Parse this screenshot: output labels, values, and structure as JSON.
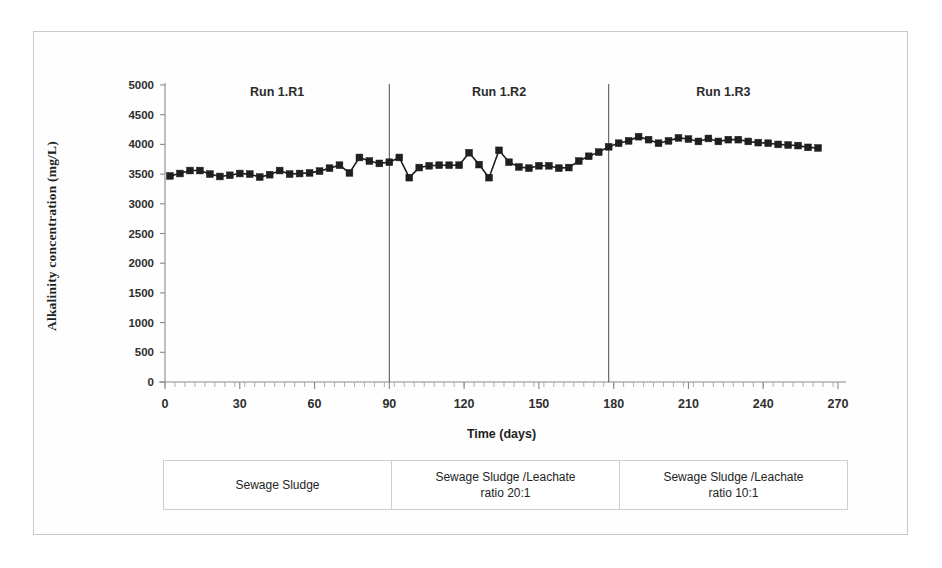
{
  "chart_data": {
    "type": "line",
    "title": "",
    "xlabel": "Time (days)",
    "ylabel": "Alkalinity concentration (mg/L)",
    "xlim": [
      0,
      270
    ],
    "ylim": [
      0,
      5000
    ],
    "y_ticks": [
      0,
      500,
      1000,
      1500,
      2000,
      2500,
      3000,
      3500,
      4000,
      4500,
      5000
    ],
    "x_ticks": [
      0,
      30,
      60,
      90,
      120,
      150,
      180,
      210,
      240,
      270
    ],
    "x_minor_tick_step": 4,
    "grid": false,
    "legend": "none",
    "marker": "square",
    "marker_color": "#1f1f1f",
    "line_color": "#1c1c1c",
    "series": [
      {
        "name": "Alkalinity concentration",
        "x": [
          2,
          6,
          10,
          14,
          18,
          22,
          26,
          30,
          34,
          38,
          42,
          46,
          50,
          54,
          58,
          62,
          66,
          70,
          74,
          78,
          82,
          86,
          90,
          94,
          98,
          102,
          106,
          110,
          114,
          118,
          122,
          126,
          130,
          134,
          138,
          142,
          146,
          150,
          154,
          158,
          162,
          166,
          170,
          174,
          178,
          182,
          186,
          190,
          194,
          198,
          202,
          206,
          210,
          214,
          218,
          222,
          226,
          230,
          234,
          238,
          242,
          246,
          250,
          254,
          258,
          262
        ],
        "y": [
          3470,
          3510,
          3560,
          3560,
          3500,
          3460,
          3480,
          3510,
          3500,
          3450,
          3490,
          3560,
          3500,
          3510,
          3520,
          3550,
          3600,
          3650,
          3520,
          3780,
          3720,
          3680,
          3700,
          3780,
          3440,
          3610,
          3640,
          3650,
          3650,
          3650,
          3860,
          3660,
          3440,
          3900,
          3700,
          3620,
          3600,
          3640,
          3640,
          3600,
          3610,
          3720,
          3800,
          3870,
          3960,
          4020,
          4060,
          4130,
          4080,
          4020,
          4060,
          4110,
          4090,
          4050,
          4100,
          4050,
          4080,
          4080,
          4050,
          4030,
          4020,
          4000,
          3990,
          3980,
          3950,
          3940
        ]
      }
    ],
    "dividers": [
      {
        "x": 90,
        "label": "Run 1.R1 / Run 1.R2 boundary"
      },
      {
        "x": 178,
        "label": "Run 1.R2 / Run 1.R3 boundary"
      }
    ],
    "annotations": [
      {
        "text": "Run 1.R1",
        "x": 45,
        "y": 4820
      },
      {
        "text": "Run 1.R2",
        "x": 134,
        "y": 4820
      },
      {
        "text": "Run 1.R3",
        "x": 224,
        "y": 4820
      }
    ]
  },
  "axis": {
    "y_title": "Alkalinity concentration (mg/L)",
    "x_title": "Time (days)",
    "y_tick_labels": [
      "5000",
      "4500",
      "4000",
      "3500",
      "3000",
      "2500",
      "2000",
      "1500",
      "1000",
      "500",
      "0"
    ],
    "x_tick_labels": [
      "0",
      "30",
      "60",
      "90",
      "120",
      "150",
      "180",
      "210",
      "240",
      "270"
    ]
  },
  "run_labels": [
    "Run 1.R1",
    "Run 1.R2",
    "Run 1.R3"
  ],
  "legend_boxes": [
    {
      "line1": "Sewage Sludge",
      "line2": ""
    },
    {
      "line1": "Sewage Sludge /Leachate",
      "line2": "ratio 20:1"
    },
    {
      "line1": "Sewage Sludge /Leachate",
      "line2": "ratio 10:1"
    }
  ],
  "colors": {
    "marker": "#1f1f1f",
    "axis": "#8a8a8a",
    "divider": "#5a5a5a",
    "border": "#c9c9c9"
  }
}
